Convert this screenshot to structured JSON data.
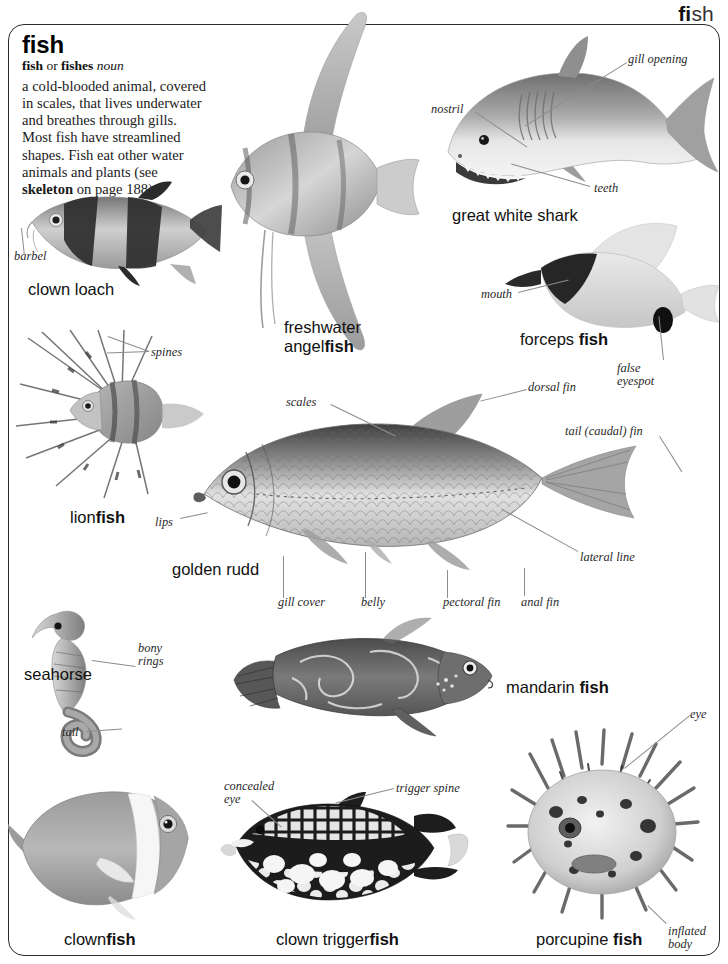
{
  "running_head": {
    "bold_part": "fi",
    "light_part": "sh"
  },
  "entry": {
    "headword": "fish",
    "inflections_plain1": "fish",
    "inflections_or": " or ",
    "inflections_plain2": "fishes",
    "part_of_speech": "noun",
    "definition_part1": "a cold-blooded animal, covered in scales, that lives underwater and breathes through gills. Most fish have streamlined shapes. Fish eat other water animals and plants (see ",
    "definition_crossref": "skeleton",
    "definition_part2": " on page 188)."
  },
  "specimens": [
    {
      "id": "clown-loach",
      "caption_light": "clown loach",
      "caption_bold": ""
    },
    {
      "id": "freshwater-angelfish",
      "caption_light": "freshwater",
      "caption_bold2_light": "angel",
      "caption_bold": "fish"
    },
    {
      "id": "great-white-shark",
      "caption_light": "great white shark",
      "caption_bold": ""
    },
    {
      "id": "forceps-fish",
      "caption_light": "forceps ",
      "caption_bold": "fish"
    },
    {
      "id": "lionfish",
      "caption_light": "lion",
      "caption_bold": "fish"
    },
    {
      "id": "golden-rudd",
      "caption_light": "golden rudd",
      "caption_bold": ""
    },
    {
      "id": "seahorse",
      "caption_light": "seahorse",
      "caption_bold": ""
    },
    {
      "id": "mandarin-fish",
      "caption_light": "mandarin ",
      "caption_bold": "fish"
    },
    {
      "id": "clownfish",
      "caption_light": "clown",
      "caption_bold": "fish"
    },
    {
      "id": "clown-triggerfish",
      "caption_light": "clown trigger",
      "caption_bold": "fish"
    },
    {
      "id": "porcupine-fish",
      "caption_light": "porcupine ",
      "caption_bold": "fish"
    }
  ],
  "labels": {
    "barbel": "barbel",
    "spines": "spines",
    "nostril": "nostril",
    "gill_opening": "gill opening",
    "teeth": "teeth",
    "mouth": "mouth",
    "false_eyespot_l1": "false",
    "false_eyespot_l2": "eyespot",
    "scales": "scales",
    "dorsal_fin": "dorsal fin",
    "tail_caudal_fin": "tail (caudal) fin",
    "lateral_line": "lateral line",
    "lips": "lips",
    "gill_cover": "gill cover",
    "belly": "belly",
    "pectoral_fin": "pectoral fin",
    "anal_fin": "anal fin",
    "bony_rings_l1": "bony",
    "bony_rings_l2": "rings",
    "tail": "tail",
    "concealed_eye_l1": "concealed",
    "concealed_eye_l2": "eye",
    "trigger_spine": "trigger spine",
    "eye": "eye",
    "inflated_body_l1": "inflated",
    "inflated_body_l2": "body"
  },
  "colors": {
    "ink": "#1a1a1a",
    "leader": "#8c8c8c",
    "frame": "#2b2b2b",
    "fish_dark": "#3c3c3c",
    "fish_mid": "#8a8a8a",
    "fish_light": "#cfcfcf"
  }
}
